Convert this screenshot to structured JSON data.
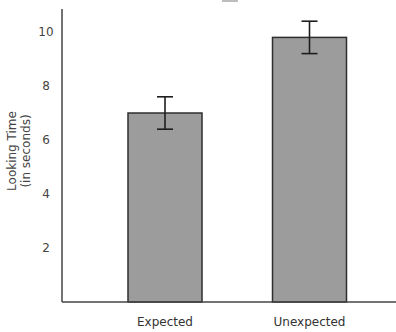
{
  "chart_data": {
    "type": "bar",
    "title": "",
    "xlabel": "",
    "ylabel": "Looking Time (in seconds)",
    "ylabel_lines": [
      "Looking Time",
      "(in seconds)"
    ],
    "categories": [
      "Expected",
      "Unexpected"
    ],
    "values": [
      7.0,
      9.8
    ],
    "error": [
      0.6,
      0.6
    ],
    "ylim": [
      0,
      10.8
    ],
    "yticks": [
      2,
      4,
      6,
      8,
      10
    ],
    "grid": false,
    "legend": null,
    "colors": {
      "bar_fill": "#9c9c9c",
      "bar_edge": "#2e2e2e",
      "axis": "#444444"
    }
  }
}
